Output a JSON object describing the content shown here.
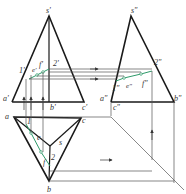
{
  "diagram": {
    "type": "orthographic-projection",
    "colors": {
      "outline": "#1a1a1a",
      "projection_line": "#555555",
      "section_line": "#2e9a6a",
      "point_marker": "#2e9a6a"
    },
    "front_view": {
      "labels": {
        "apex": "s'",
        "a": "a'",
        "b": "b'",
        "c": "c'",
        "p1": "1'",
        "p2": "2'",
        "e": "e'",
        "f": "f'"
      }
    },
    "side_view": {
      "labels": {
        "apex": "s\"",
        "a": "a\"",
        "b": "b\"",
        "c": "c\"",
        "p1": "1\"",
        "p2": "2\"",
        "e": "e\"",
        "f": "f\""
      }
    },
    "top_view": {
      "labels": {
        "a": "a",
        "b": "b",
        "c": "c",
        "s": "s",
        "p1": "1",
        "p2": "2",
        "e": "e",
        "f": "f"
      }
    }
  }
}
